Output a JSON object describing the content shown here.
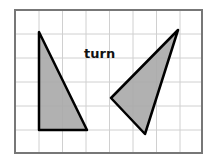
{
  "diagram": {
    "label": "turn",
    "grid": {
      "columns": 8,
      "rows": 6,
      "line_color": "#d0d0d0",
      "border_color": "#777777"
    },
    "shapes": [
      {
        "name": "left-triangle",
        "points": "39,32 39,130 87,130",
        "fill": "#a9a9a9",
        "stroke": "#000000"
      },
      {
        "name": "right-triangle",
        "points": "178,30 111,98 145,134",
        "fill": "#a9a9a9",
        "stroke": "#000000"
      }
    ]
  }
}
